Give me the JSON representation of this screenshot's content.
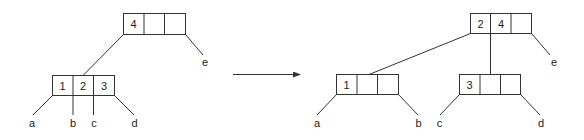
{
  "diagram": {
    "type": "b-tree-split",
    "before": {
      "root": {
        "keys": [
          "4",
          "",
          ""
        ]
      },
      "child": {
        "keys": [
          "1",
          "2",
          "3"
        ]
      },
      "leaf_labels": [
        "a",
        "b",
        "c",
        "d"
      ],
      "right_label": "e"
    },
    "arrow": "→",
    "after": {
      "root": {
        "keys": [
          "2",
          "4",
          ""
        ]
      },
      "left_child": {
        "keys": [
          "1",
          "",
          ""
        ]
      },
      "right_child": {
        "keys": [
          "3",
          "",
          ""
        ]
      },
      "left_labels": [
        "a",
        "b"
      ],
      "right_labels": [
        "c",
        "d"
      ],
      "right_label": "e"
    }
  },
  "colors": {
    "stroke": "#333333",
    "text": "#222222",
    "background": "#ffffff"
  }
}
